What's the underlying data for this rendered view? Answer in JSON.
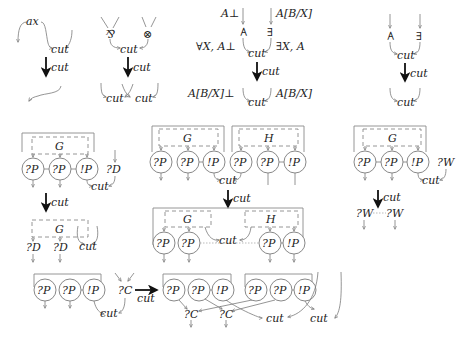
{
  "cut_label": "cut",
  "rules": {
    "axiom": {
      "ax_label": "ax",
      "top_cut": "cut",
      "arrow_label": "cut"
    },
    "par_tensor": {
      "par_symbol": "⅋",
      "tensor_symbol": "⊗",
      "top_cut": "cut",
      "arrow_label": "cut",
      "bottom_cut_left": "cut",
      "bottom_cut_right": "cut"
    },
    "quantifier_labeled": {
      "forall_symbol": "∀",
      "exists_symbol": "∃",
      "in_left": "A⊥",
      "in_right": "A[B/X]",
      "out_left": "∀X, A⊥",
      "out_right": "∃X, A",
      "top_cut": "cut",
      "arrow_label": "cut",
      "bottom_left": "A[B/X]⊥",
      "bottom_right": "A[B/X]",
      "bottom_cut": "cut"
    },
    "quantifier_plain": {
      "forall_symbol": "∀",
      "exists_symbol": "∃",
      "top_cut": "cut",
      "arrow_label": "cut",
      "bottom_cut": "cut"
    },
    "dereliction": {
      "box_label": "G",
      "nodes": [
        "?P",
        "?P",
        "!P"
      ],
      "other": "?D",
      "top_cut": "cut",
      "arrow_label": "cut",
      "result_box_label": "G",
      "result_nodes": [
        "?D",
        "?D"
      ],
      "result_cut": "cut"
    },
    "box_box": {
      "box_g_label": "G",
      "box_h_label": "H",
      "g_nodes": [
        "?P",
        "?P",
        "!P"
      ],
      "h_nodes": [
        "?P",
        "?P",
        "!P"
      ],
      "top_cut": "cut",
      "arrow_label": "cut",
      "result_g_label": "G",
      "result_h_label": "H",
      "result_left_nodes": [
        "?P",
        "?P"
      ],
      "result_right_nodes": [
        "?P",
        "!P"
      ],
      "result_cut": "cut"
    },
    "weakening": {
      "box_label": "G",
      "nodes": [
        "?P",
        "?P",
        "!P"
      ],
      "other": "?W",
      "top_cut": "cut",
      "arrow_label": "cut",
      "result_nodes": [
        "?W",
        "?W"
      ]
    },
    "contraction": {
      "nodes": [
        "?P",
        "?P",
        "!P"
      ],
      "other": "?C",
      "top_cut": "cut",
      "arrow_label": "cut",
      "copy1_nodes": [
        "?P",
        "?P",
        "!P"
      ],
      "copy2_nodes": [
        "?P",
        "?P",
        "!P"
      ],
      "result_contractions": [
        "?C",
        "?C"
      ],
      "result_cut_left": "cut",
      "result_cut_right": "cut"
    }
  }
}
